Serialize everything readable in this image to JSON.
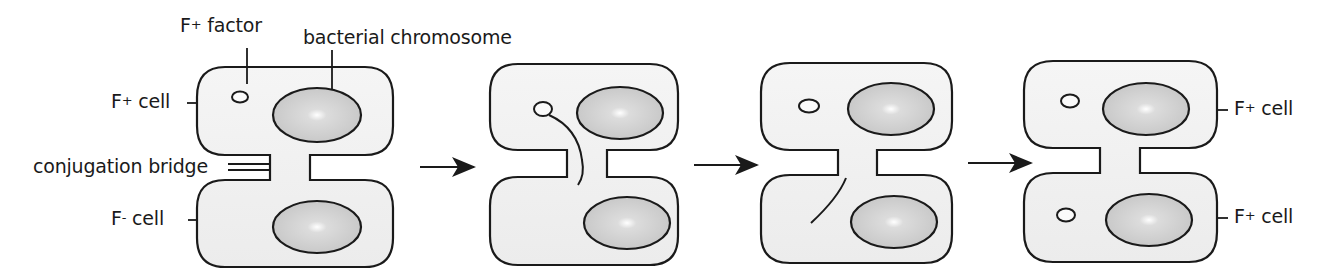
{
  "figure": {
    "colors": {
      "cell_fill": "#f2f2f2",
      "chromosome_fill": "#c9c9c9",
      "outline": "#1a1a1a",
      "background": "#ffffff"
    }
  },
  "labels": {
    "f_factor": {
      "base": "F",
      "sup": "+",
      "rest": " factor"
    },
    "bacterial_chromosome": "bacterial chromosome",
    "f_plus_cell_left": {
      "base": "F",
      "sup": "+",
      "rest": " cell"
    },
    "conjugation_bridge": "conjugation bridge",
    "f_minus_cell_left": {
      "base": "F",
      "sup": "-",
      "rest": " cell"
    },
    "f_plus_cell_right_top": {
      "base": "F",
      "sup": "+",
      "rest": " cell"
    },
    "f_plus_cell_right_bottom": {
      "base": "F",
      "sup": "+",
      "rest": " cell"
    }
  },
  "stages": [
    {
      "id": 1,
      "description": "F+ cell with F factor plasmid connected to F- cell by conjugation bridge"
    },
    {
      "id": 2,
      "description": "F factor nicked; single strand begins transfer through bridge"
    },
    {
      "id": 3,
      "description": "Single-stranded F factor copy enters recipient cell"
    },
    {
      "id": 4,
      "description": "Both cells contain F factor; both are now F+ cells"
    }
  ],
  "arrows": [
    {
      "from": 1,
      "to": 2,
      "icon": "right-arrow-icon"
    },
    {
      "from": 2,
      "to": 3,
      "icon": "right-arrow-icon"
    },
    {
      "from": 3,
      "to": 4,
      "icon": "right-arrow-icon"
    }
  ]
}
